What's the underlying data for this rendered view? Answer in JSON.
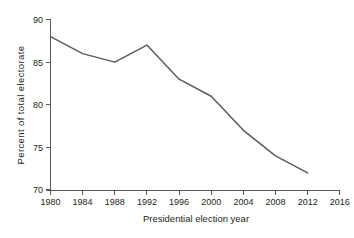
{
  "chart_data": {
    "type": "line",
    "title": "",
    "xlabel": "Presidential election year",
    "ylabel": "Percent of total electorate",
    "x": [
      1980,
      1984,
      1988,
      1992,
      1996,
      2000,
      2004,
      2008,
      2012
    ],
    "values": [
      88,
      86,
      85,
      87,
      83,
      81,
      77,
      74,
      72
    ],
    "series": [
      {
        "name": "Percent of total electorate",
        "values": [
          88,
          86,
          85,
          87,
          83,
          81,
          77,
          74,
          72
        ]
      }
    ],
    "xlim": [
      1980,
      2016
    ],
    "ylim": [
      70,
      90
    ],
    "xticks": [
      1980,
      1984,
      1988,
      1992,
      1996,
      2000,
      2004,
      2008,
      2012,
      2016
    ],
    "xtick_labels": [
      "1980",
      "1984",
      "1988",
      "1992",
      "1996",
      "2000",
      "2004",
      "2008",
      "2012",
      "2016"
    ],
    "yticks": [
      70,
      75,
      80,
      85,
      90
    ],
    "ytick_labels": [
      "70",
      "75",
      "80",
      "85",
      "90"
    ],
    "grid": false,
    "legend": false,
    "line_color": "#5a5b5d",
    "axis_color": "#58595b",
    "text_color": "#231f20",
    "background": "#ffffff"
  }
}
